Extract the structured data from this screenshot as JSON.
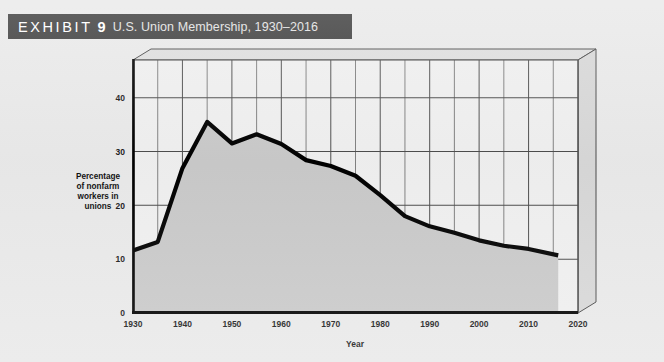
{
  "header": {
    "exhibit_word": "EXHIBIT",
    "exhibit_number": "9",
    "title": "U.S. Union Membership, 1930–2016",
    "bar_color": "#3d3d3d",
    "text_color": "#ffffff"
  },
  "chart_data": {
    "type": "area",
    "title": "U.S. Union Membership, 1930–2016",
    "xlabel": "Year",
    "ylabel_lines": [
      "Percentage",
      "of nonfarm",
      "workers in",
      "unions"
    ],
    "ylabel": "Percentage of nonfarm workers in unions",
    "xlim": [
      1930,
      2020
    ],
    "ylim": [
      0,
      47
    ],
    "x_ticks": [
      1930,
      1940,
      1950,
      1960,
      1970,
      1980,
      1990,
      2000,
      2010,
      2020
    ],
    "x_tick_labels": [
      "1930",
      "1940",
      "1950",
      "1960",
      "1970",
      "1980",
      "1990",
      "2000",
      "2010",
      "2020"
    ],
    "y_ticks": [
      0,
      10,
      20,
      30,
      40
    ],
    "y_tick_labels": [
      "0",
      "10",
      "20",
      "30",
      "40"
    ],
    "grid": true,
    "grid_x_step": 5,
    "grid_y_step": 10,
    "legend": null,
    "line_color": "#000000",
    "fill_color": "#c9c9c9",
    "plot_bg_color": "#efefef",
    "series": [
      {
        "name": "Percentage of nonfarm workers in unions",
        "x": [
          1930,
          1935,
          1940,
          1945,
          1950,
          1955,
          1960,
          1965,
          1970,
          1975,
          1980,
          1985,
          1990,
          1995,
          2000,
          2005,
          2010,
          2016
        ],
        "values": [
          11.6,
          13.2,
          26.9,
          35.5,
          31.5,
          33.2,
          31.4,
          28.4,
          27.3,
          25.5,
          21.9,
          18.0,
          16.1,
          14.9,
          13.5,
          12.5,
          11.9,
          10.7
        ]
      }
    ]
  }
}
